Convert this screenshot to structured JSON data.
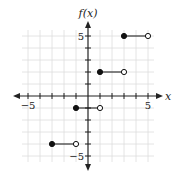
{
  "chart_data": {
    "type": "line",
    "subtype": "step-function",
    "title": "",
    "xlabel": "x",
    "ylabel": "f(x)",
    "xlim": [
      -5.5,
      5.5
    ],
    "ylim": [
      -5.5,
      5.5
    ],
    "grid": true,
    "x_tick_labels": [
      {
        "value": -5,
        "label": "−5"
      },
      {
        "value": 5,
        "label": "5"
      }
    ],
    "y_tick_labels": [
      {
        "value": 5,
        "label": "5"
      },
      {
        "value": -5,
        "label": "−5"
      }
    ],
    "segments": [
      {
        "x_start": -3,
        "x_end": -1,
        "y": -4,
        "start_closed": true,
        "end_closed": false
      },
      {
        "x_start": -1,
        "x_end": 1,
        "y": -1,
        "start_closed": true,
        "end_closed": false
      },
      {
        "x_start": 1,
        "x_end": 3,
        "y": 2,
        "start_closed": true,
        "end_closed": false
      },
      {
        "x_start": 3,
        "x_end": 5,
        "y": 5,
        "start_closed": true,
        "end_closed": false
      }
    ],
    "colors": {
      "axis": "#222222",
      "grid": "#dddddd",
      "series": "#111111"
    }
  }
}
